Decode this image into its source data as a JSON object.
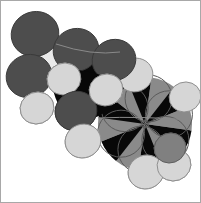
{
  "figure": {
    "title": "Space-filling molecular model",
    "width": 201,
    "height": 203,
    "background_color": "#ffffff",
    "border_color": "#a8a8a8"
  },
  "palette": {
    "background": "#ffffff",
    "carbon_dark": "#4d4d4d",
    "carbon_dark_shade": "#3f3f3f",
    "carbon_mid": "#808080",
    "carbon_mid_shade": "#6b6b6b",
    "hydrogen_light": "#d6d6d6",
    "hydrogen_light_shade": "#c2c2c2",
    "hydrogen_white": "#eaeaea",
    "occlusion_black": "#080808",
    "outline": "#5a5a5a",
    "outline_light": "#8a8a8a"
  },
  "model": {
    "render_style": "space-filling-cpk",
    "shading": "flat-grayscale",
    "orientation": "diagonal-upper-left-to-lower-right",
    "atom_count": 24,
    "atoms": [
      {
        "id": "a1",
        "label": "C",
        "cx": 35,
        "cy": 34,
        "r": 24,
        "fill": "#4d4d4d",
        "stroke": "#3a3a3a",
        "z": 9
      },
      {
        "id": "a2",
        "label": "C",
        "cx": 29,
        "cy": 76,
        "r": 23,
        "fill": "#4d4d4d",
        "stroke": "#3a3a3a",
        "z": 9
      },
      {
        "id": "a3",
        "label": "H",
        "cx": 59,
        "cy": 60,
        "r": 21,
        "fill": "#eaeaea",
        "stroke": "#9a9a9a",
        "z": 5
      },
      {
        "id": "a4",
        "label": "C",
        "cx": 76,
        "cy": 50,
        "r": 23,
        "fill": "#4d4d4d",
        "stroke": "#3a3a3a",
        "z": 9
      },
      {
        "id": "a5",
        "label": "K",
        "cx": 86,
        "cy": 86,
        "r": 30,
        "fill": "#080808",
        "stroke": "#080808",
        "z": 4
      },
      {
        "id": "a6",
        "label": "H",
        "cx": 64,
        "cy": 79,
        "r": 17,
        "fill": "#d6d6d6",
        "stroke": "#8f8f8f",
        "z": 11
      },
      {
        "id": "a7",
        "label": "C",
        "cx": 114,
        "cy": 60,
        "r": 22,
        "fill": "#4d4d4d",
        "stroke": "#3a3a3a",
        "z": 9
      },
      {
        "id": "a8",
        "label": "H",
        "cx": 135,
        "cy": 75,
        "r": 18,
        "fill": "#d6d6d6",
        "stroke": "#8f8f8f",
        "z": 8
      },
      {
        "id": "a9",
        "label": "H",
        "cx": 37,
        "cy": 108,
        "r": 17,
        "fill": "#d6d6d6",
        "stroke": "#8f8f8f",
        "z": 11
      },
      {
        "id": "a10",
        "label": "C",
        "cx": 76,
        "cy": 111,
        "r": 21,
        "fill": "#4d4d4d",
        "stroke": "#3a3a3a",
        "z": 10
      },
      {
        "id": "a11",
        "label": "H",
        "cx": 106,
        "cy": 90,
        "r": 17,
        "fill": "#d6d6d6",
        "stroke": "#8f8f8f",
        "z": 12
      },
      {
        "id": "a12",
        "label": "H",
        "cx": 83,
        "cy": 141,
        "r": 18,
        "fill": "#d6d6d6",
        "stroke": "#8f8f8f",
        "z": 11
      },
      {
        "id": "a13",
        "label": "C",
        "cx": 145,
        "cy": 125,
        "r": 46,
        "fill": "#808080",
        "stroke": "#5e5e5e",
        "z": 3
      },
      {
        "id": "a14",
        "label": "H",
        "cx": 146,
        "cy": 172,
        "r": 18,
        "fill": "#d6d6d6",
        "stroke": "#8f8f8f",
        "z": 13
      },
      {
        "id": "a15",
        "label": "H",
        "cx": 174,
        "cy": 165,
        "r": 17,
        "fill": "#d6d6d6",
        "stroke": "#8f8f8f",
        "z": 13
      },
      {
        "id": "a16",
        "label": "C",
        "cx": 170,
        "cy": 148,
        "r": 16,
        "fill": "#808080",
        "stroke": "#5e5e5e",
        "z": 12
      },
      {
        "id": "a17",
        "label": "H",
        "cx": 185,
        "cy": 97,
        "r": 16,
        "fill": "#d6d6d6",
        "stroke": "#8f8f8f",
        "z": 6
      }
    ],
    "pinwheel": {
      "center_x": 145,
      "center_y": 124,
      "radius": 47,
      "wedge_count": 12,
      "dark_fill": "#080808",
      "light_fill": "#8a8a8a",
      "start_angle_deg": 8
    }
  },
  "labels": {
    "caption": "Space-filling molecular model",
    "figure_name": "molecule-space-filling-model"
  }
}
